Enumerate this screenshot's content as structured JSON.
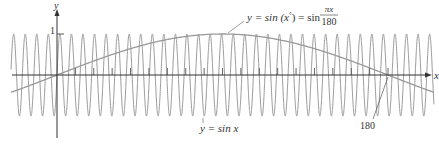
{
  "chart_data": {
    "type": "line",
    "title": "",
    "xlabel": "x",
    "ylabel": "y",
    "xlim": [
      -25,
      205
    ],
    "ylim": [
      -1,
      1
    ],
    "y_tick_labels": [
      "1"
    ],
    "x_tick_step": 10,
    "x_tick_range": [
      10,
      180
    ],
    "grid": false,
    "series": [
      {
        "name": "y = sin x",
        "function": "sin(x)",
        "x_range": [
          -25,
          205
        ],
        "color": "#9a9a9a"
      },
      {
        "name": "y = sin(x°) = sin πx/180",
        "function": "sin(pi*x/180)",
        "x_range": [
          -25,
          205
        ],
        "color": "#9a9a9a"
      }
    ],
    "annotations": [
      {
        "text": "180",
        "points_to_x": 180,
        "points_to_y": 0
      }
    ]
  },
  "labels": {
    "y_axis": "y",
    "x_axis": "x",
    "y_tick_one": "1",
    "fast_curve": {
      "prefix": "y = sin ",
      "var": "x"
    },
    "slow_curve": {
      "lhs": "y = sin (",
      "var": "x",
      "deg": "°",
      "mid": ") = sin ",
      "num": "πx",
      "den": "180"
    },
    "annotation_180": "180"
  }
}
